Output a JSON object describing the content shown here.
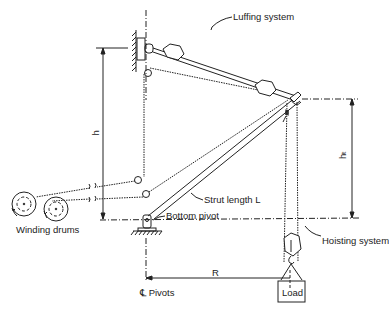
{
  "diagram": {
    "labels": {
      "luffing_system": "Luffing system",
      "strut_length": "Strut length L",
      "bottom_pivot": "Bottom pivot",
      "hoisting_system": "Hoisting system",
      "winding_drums": "Winding drums",
      "pivots": "℄ Pivots",
      "load": "Load",
      "radius": "R",
      "height_h": "h",
      "height_ht": "hₜ"
    },
    "colors": {
      "line": "#222222",
      "background": "#ffffff"
    }
  }
}
